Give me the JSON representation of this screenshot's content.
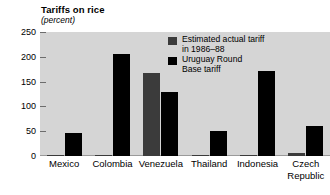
{
  "chart_data": {
    "type": "bar",
    "title": "Tariffs on rice",
    "subtitle": "(percent)",
    "xlabel": "",
    "ylabel": "",
    "ylim": [
      0,
      250
    ],
    "yticks": [
      0,
      50,
      100,
      150,
      200,
      250
    ],
    "ytick_labels": [
      "0",
      "50",
      "100",
      "150",
      "200",
      "250"
    ],
    "grid": false,
    "legend_position": "top-right",
    "categories": [
      "Mexico",
      "Colombia",
      "Venezuela",
      "Thailand",
      "Indonesia",
      "Czech Republic"
    ],
    "category_lines": [
      [
        "Mexico"
      ],
      [
        "Colombia"
      ],
      [
        "Venezuela"
      ],
      [
        "Thailand"
      ],
      [
        "Indonesia"
      ],
      [
        "Czech",
        "Republic"
      ]
    ],
    "series": [
      {
        "name": "Estimated actual tariff in 1986–88",
        "name_lines": [
          "Estimated actual tariff",
          "in 1986–88"
        ],
        "color": "#3b3b3b",
        "values": [
          3,
          1,
          168,
          1,
          2,
          6
        ]
      },
      {
        "name": "Uruguay Round Base tariff",
        "name_lines": [
          "Uruguay Round",
          "Base tariff"
        ],
        "color": "#000000",
        "values": [
          46,
          205,
          130,
          50,
          172,
          60
        ]
      }
    ]
  },
  "style": {
    "plot_background": "#d5d5d5",
    "page_background": "#ffffff",
    "text_color": "#000000",
    "tick_color": "#6d6d6d"
  }
}
